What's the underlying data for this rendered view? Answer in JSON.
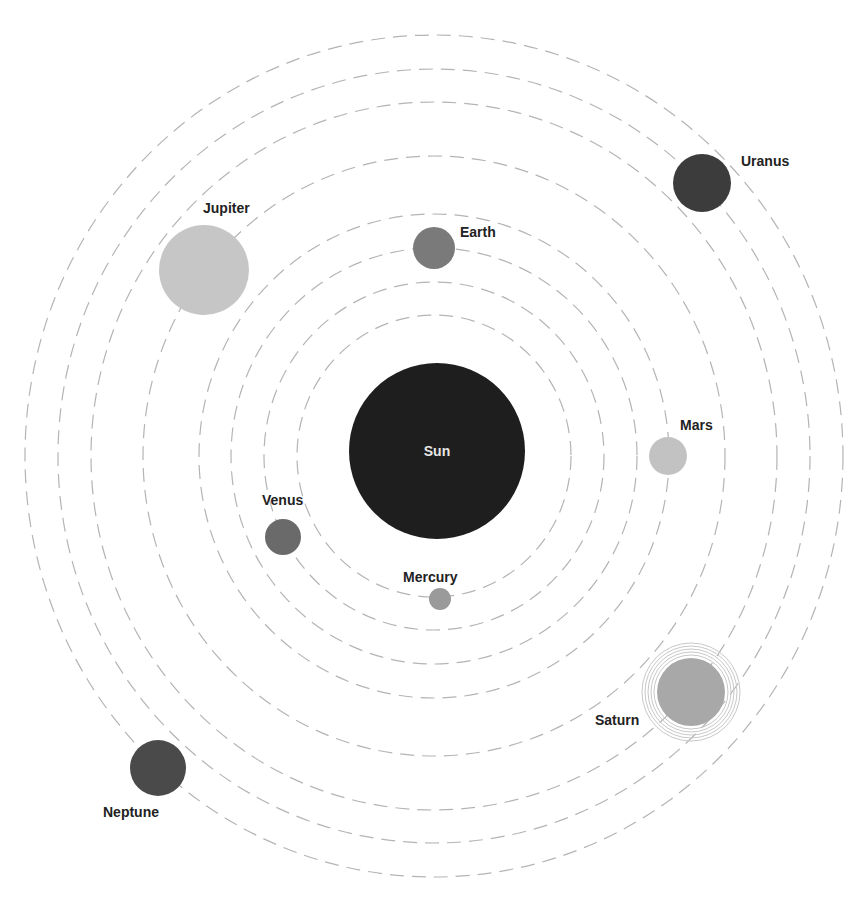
{
  "center": {
    "x": 434,
    "y": 456
  },
  "orbits": [
    {
      "rx": 137,
      "ry": 141
    },
    {
      "rx": 170,
      "ry": 174
    },
    {
      "rx": 203,
      "ry": 208
    },
    {
      "rx": 235,
      "ry": 242
    },
    {
      "rx": 291,
      "ry": 300
    },
    {
      "rx": 343,
      "ry": 354
    },
    {
      "rx": 376,
      "ry": 387
    },
    {
      "rx": 409,
      "ry": 421
    }
  ],
  "sun": {
    "label": "Sun",
    "cx": 437,
    "cy": 451,
    "r": 88,
    "color": "#1e1e1e",
    "label_x": 437,
    "label_y": 456
  },
  "planets": [
    {
      "id": "mercury",
      "label": "Mercury",
      "cx": 440,
      "cy": 599,
      "r": 11,
      "color": "#9a9a9a",
      "label_x": 403,
      "label_y": 582
    },
    {
      "id": "venus",
      "label": "Venus",
      "cx": 283,
      "cy": 537,
      "r": 18,
      "color": "#6a6a6a",
      "label_x": 262,
      "label_y": 505
    },
    {
      "id": "earth",
      "label": "Earth",
      "cx": 434,
      "cy": 248,
      "r": 21,
      "color": "#7a7a7a",
      "label_x": 460,
      "label_y": 237
    },
    {
      "id": "mars",
      "label": "Mars",
      "cx": 668,
      "cy": 456,
      "r": 19,
      "color": "#c2c2c2",
      "label_x": 680,
      "label_y": 430
    },
    {
      "id": "jupiter",
      "label": "Jupiter",
      "cx": 204,
      "cy": 270,
      "r": 45,
      "color": "#c6c6c6",
      "label_x": 203,
      "label_y": 213
    },
    {
      "id": "saturn",
      "label": "Saturn",
      "cx": 691,
      "cy": 692,
      "r": 34,
      "color": "#a8a8a8",
      "label_x": 595,
      "label_y": 725,
      "rings": [
        37,
        40,
        43,
        46,
        49
      ]
    },
    {
      "id": "uranus",
      "label": "Uranus",
      "cx": 702,
      "cy": 183,
      "r": 29,
      "color": "#3c3c3c",
      "label_x": 741,
      "label_y": 166
    },
    {
      "id": "neptune",
      "label": "Neptune",
      "cx": 158,
      "cy": 768,
      "r": 28,
      "color": "#4a4a4a",
      "label_x": 103,
      "label_y": 817
    }
  ]
}
